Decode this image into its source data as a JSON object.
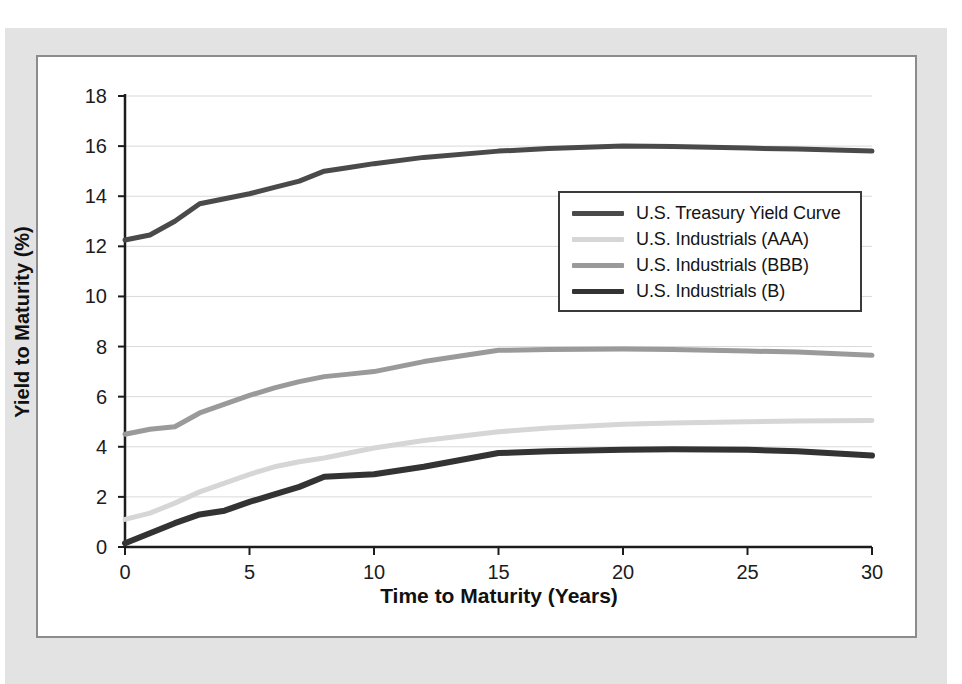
{
  "chart_data": {
    "type": "line",
    "title": "",
    "subtitle": "",
    "xlabel": "Time to Maturity (Years)",
    "ylabel": "Yield to Maturity (%)",
    "xlim": [
      0,
      30
    ],
    "ylim": [
      0,
      18
    ],
    "xticks": [
      "0",
      "5",
      "10",
      "15",
      "20",
      "25",
      "30"
    ],
    "yticks": [
      "0",
      "2",
      "4",
      "6",
      "8",
      "10",
      "12",
      "14",
      "16",
      "18"
    ],
    "grid": "horizontal",
    "legend_position": "center-right",
    "series": [
      {
        "name": "U.S. Treasury Yield Curve",
        "color": "#4a4a4a",
        "width": 5,
        "x": [
          0,
          1,
          2,
          3,
          4,
          5,
          6,
          7,
          8,
          9,
          10,
          12,
          15,
          17,
          20,
          22,
          25,
          27,
          30
        ],
        "values": [
          12.25,
          12.45,
          13.0,
          13.7,
          13.9,
          14.1,
          14.35,
          14.6,
          15.0,
          15.15,
          15.3,
          15.55,
          15.8,
          15.9,
          16.0,
          15.98,
          15.92,
          15.88,
          15.8
        ]
      },
      {
        "name": "U.S. Industrials (AAA)",
        "color": "#d6d6d6",
        "width": 5,
        "x": [
          0,
          1,
          2,
          3,
          4,
          5,
          6,
          7,
          8,
          9,
          10,
          12,
          15,
          17,
          20,
          22,
          25,
          27,
          30
        ],
        "values": [
          1.1,
          1.35,
          1.75,
          2.2,
          2.55,
          2.9,
          3.2,
          3.4,
          3.55,
          3.75,
          3.95,
          4.25,
          4.6,
          4.75,
          4.9,
          4.95,
          5.0,
          5.03,
          5.05
        ]
      },
      {
        "name": "U.S. Industrials (BBB)",
        "color": "#9a9a9a",
        "width": 5,
        "x": [
          0,
          1,
          2,
          3,
          4,
          5,
          6,
          7,
          8,
          9,
          10,
          12,
          15,
          17,
          20,
          22,
          25,
          27,
          30
        ],
        "values": [
          4.5,
          4.7,
          4.8,
          5.35,
          5.7,
          6.05,
          6.35,
          6.6,
          6.8,
          6.9,
          7.0,
          7.4,
          7.85,
          7.88,
          7.9,
          7.88,
          7.82,
          7.78,
          7.65
        ]
      },
      {
        "name": "U.S. Industrials (B)",
        "color": "#333333",
        "width": 6,
        "x": [
          0,
          1,
          2,
          3,
          4,
          5,
          6,
          7,
          8,
          9,
          10,
          12,
          15,
          17,
          20,
          22,
          25,
          27,
          30
        ],
        "values": [
          0.15,
          0.55,
          0.95,
          1.3,
          1.45,
          1.8,
          2.1,
          2.4,
          2.8,
          2.85,
          2.9,
          3.2,
          3.75,
          3.82,
          3.88,
          3.9,
          3.88,
          3.82,
          3.65
        ]
      }
    ]
  },
  "axes": {
    "y_title": "Yield to Maturity (%)",
    "x_title": "Time to Maturity (Years)",
    "y_ticks": [
      "18",
      "16",
      "14",
      "12",
      "10",
      "8",
      "6",
      "4",
      "2",
      "0"
    ],
    "x_ticks": [
      "0",
      "5",
      "10",
      "15",
      "20",
      "25",
      "30"
    ]
  },
  "legend": {
    "items": [
      {
        "label": "U.S. Treasury Yield Curve",
        "color": "#4a4a4a"
      },
      {
        "label": "U.S. Industrials (AAA)",
        "color": "#d6d6d6"
      },
      {
        "label": "U.S. Industrials (BBB)",
        "color": "#9a9a9a"
      },
      {
        "label": "U.S. Industrials (B)",
        "color": "#333333"
      }
    ]
  },
  "style": {
    "mat_color": "#e3e3e3",
    "panel_border": "#8c8c8c",
    "axis_color": "#1c1c1c",
    "grid_color": "#d9d9d9"
  }
}
